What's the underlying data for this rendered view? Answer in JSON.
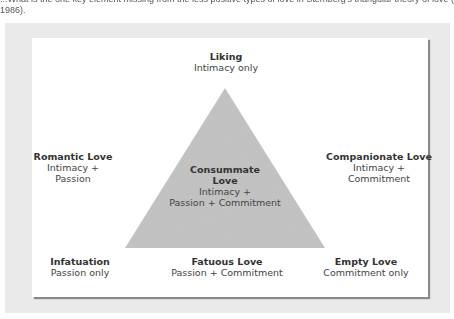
{
  "caption": {
    "line1": "...What is the one key element missing from the less positive types of love in Sternberg's triangular theory of love (Sternberg,",
    "line2": "1986)."
  },
  "diagram": {
    "colors": {
      "frame_bg": "#eaeaea",
      "card_bg": "#ffffff",
      "triangle_fill": "#c4c4c4",
      "text": "#333333"
    },
    "apex": {
      "title": "Liking",
      "desc": [
        "Intimacy only"
      ]
    },
    "left": {
      "title": "Romantic Love",
      "desc": [
        "Intimacy +",
        "Passion"
      ]
    },
    "right": {
      "title": "Companionate Love",
      "desc": [
        "Intimacy +",
        "Commitment"
      ]
    },
    "center": {
      "title": [
        "Consummate",
        "Love"
      ],
      "desc": [
        "Intimacy +",
        "Passion + Commitment"
      ]
    },
    "bottom_left": {
      "title": "Infatuation",
      "desc": [
        "Passion only"
      ]
    },
    "bottom_center": {
      "title": "Fatuous Love",
      "desc": [
        "Passion + Commitment"
      ]
    },
    "bottom_right": {
      "title": "Empty Love",
      "desc": [
        "Commitment only"
      ]
    }
  }
}
